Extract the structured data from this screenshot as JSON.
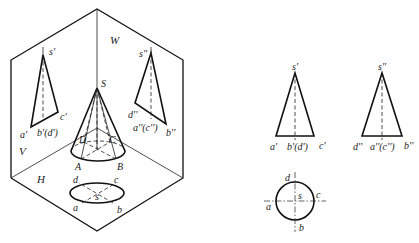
{
  "projection_box": {
    "planes": {
      "V": "V",
      "H": "H",
      "W": "W"
    },
    "cone_3d": {
      "apex": "S",
      "base_points": [
        "A",
        "B",
        "C",
        "D"
      ]
    },
    "v_plane_projection": {
      "apex": "s'",
      "left": "a'",
      "middle": "b'(d')",
      "right": "c'"
    },
    "w_plane_projection": {
      "apex": "s''",
      "left": "d''",
      "middle": "a''(c'')",
      "right": "b''"
    },
    "h_plane_projection": {
      "center": "s",
      "points": [
        "a",
        "b",
        "c",
        "d"
      ]
    }
  },
  "orthographic_views": {
    "front_view": {
      "apex": "s'",
      "left": "a'",
      "middle": "b'(d')",
      "right": "c'"
    },
    "side_view": {
      "apex": "s''",
      "left": "d''",
      "middle": "a''(c'')",
      "right": "b''"
    },
    "top_view": {
      "center": "s",
      "left": "a",
      "bottom": "b",
      "right": "c",
      "top": "d"
    }
  }
}
